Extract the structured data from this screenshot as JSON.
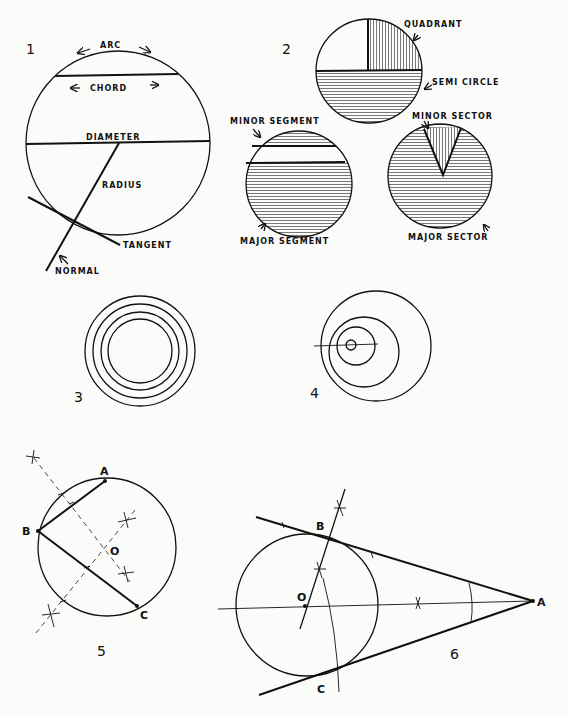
{
  "figures": [
    {
      "number": "1",
      "labels": {
        "arc": "ARC",
        "chord": "CHORD",
        "diameter": "DIAMETER",
        "radius": "RADIUS",
        "tangent": "TANGENT",
        "normal": "NORMAL"
      }
    },
    {
      "number": "2",
      "labels": {
        "quadrant": "QUADRANT",
        "semi_circle": "SEMI CIRCLE",
        "minor_segment": "MINOR SEGMENT",
        "major_segment": "MAJOR SEGMENT",
        "minor_sector": "MINOR SECTOR",
        "major_sector": "MAJOR SECTOR"
      }
    },
    {
      "number": "3",
      "caption": "Concentric circles"
    },
    {
      "number": "4",
      "caption": "Eccentric circles"
    },
    {
      "number": "5",
      "points": {
        "a": "A",
        "b": "B",
        "c": "C",
        "o": "O"
      }
    },
    {
      "number": "6",
      "points": {
        "a": "A",
        "b": "B",
        "c": "C",
        "o": "O"
      }
    }
  ]
}
